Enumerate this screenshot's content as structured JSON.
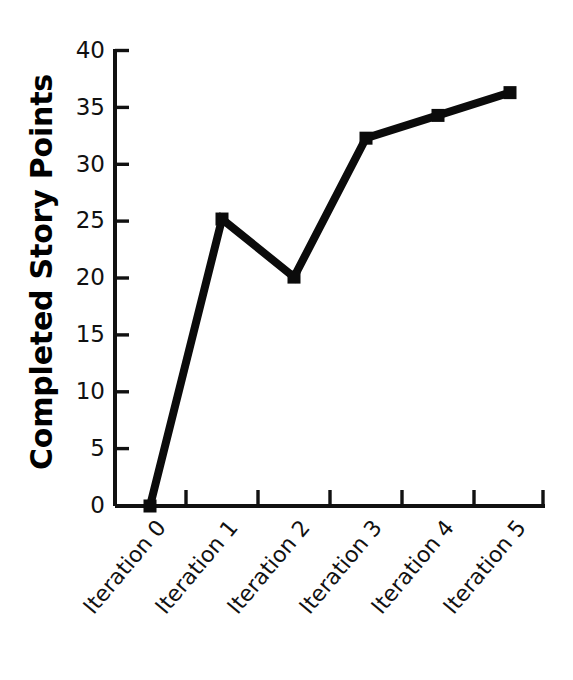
{
  "chart_data": {
    "type": "line",
    "title": "",
    "subtitle": "",
    "xlabel": "",
    "ylabel": "Completed Story Points",
    "categories": [
      "Iteration 0",
      "Iteration 1",
      "Iteration 2",
      "Iteration 3",
      "Iteration 4",
      "Iteration 5"
    ],
    "values": [
      0,
      25.2,
      20.1,
      32.3,
      34.3,
      36.3
    ],
    "series": [
      {
        "name": "Completed Story Points",
        "values": [
          0,
          25.2,
          20.1,
          32.3,
          34.3,
          36.3
        ]
      }
    ],
    "ylim": [
      0,
      40
    ],
    "yticks": [
      0,
      5,
      10,
      15,
      20,
      25,
      30,
      35,
      40
    ],
    "ytick_labels": [
      "0",
      "5",
      "10",
      "15",
      "20",
      "25",
      "30",
      "35",
      "40"
    ],
    "xtick_labels": [
      "Iteration 0",
      "Iteration 1",
      "Iteration 2",
      "Iteration 3",
      "Iteration 4",
      "Iteration 5"
    ],
    "grid": false,
    "legend": false,
    "legend_position": "none",
    "marker": "square",
    "line_color": "#0b0b0b",
    "marker_color": "#0b0b0b",
    "background_color": "#ffffff",
    "axis_color": "#111111",
    "xtick_label_rotation": 50,
    "annotations": []
  },
  "axes": {
    "y_title": "Completed Story Points",
    "y_tick_0": "0",
    "y_tick_1": "5",
    "y_tick_2": "10",
    "y_tick_3": "15",
    "y_tick_4": "20",
    "y_tick_5": "25",
    "y_tick_6": "30",
    "y_tick_7": "35",
    "y_tick_8": "40",
    "x_tick_0": "Iteration 0",
    "x_tick_1": "Iteration 1",
    "x_tick_2": "Iteration 2",
    "x_tick_3": "Iteration 3",
    "x_tick_4": "Iteration 4",
    "x_tick_5": "Iteration 5"
  }
}
